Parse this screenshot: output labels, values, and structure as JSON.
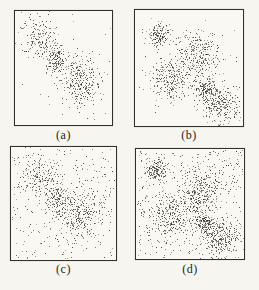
{
  "figure": {
    "background": "#f7f5f0",
    "panel_background": "#faf8f3",
    "border_color": "#33302b",
    "dot_color_rgb": [
      50,
      46,
      40
    ],
    "label_color": "#211f1c"
  },
  "chart_data": {
    "type": "scatter",
    "title": "",
    "xlabel": "",
    "ylabel": "",
    "axes_visible": false,
    "legend": "none",
    "layout": "2x2 grid of framed point plots labelled (a)-(d); coordinates below are relative (0-1) within each frame",
    "point_style": "tiny dark 1px speckle dots (scanned halftone look)",
    "panels": [
      {
        "label": "(a)",
        "description": "Three Gaussian clusters on a diagonal, almost no background noise",
        "clusters": [
          {
            "cx": 0.26,
            "cy": 0.23,
            "sx": 0.1,
            "sy": 0.095,
            "n": 180
          },
          {
            "cx": 0.42,
            "cy": 0.43,
            "sx": 0.06,
            "sy": 0.06,
            "n": 150
          },
          {
            "cx": 0.66,
            "cy": 0.62,
            "sx": 0.115,
            "sy": 0.11,
            "n": 320
          }
        ],
        "noise_n": 18,
        "seed": 101
      },
      {
        "label": "(b)",
        "description": "Five Gaussian clusters (two small tight, three large diffuse), almost no background noise",
        "clusters": [
          {
            "cx": 0.22,
            "cy": 0.21,
            "sx": 0.05,
            "sy": 0.05,
            "n": 150
          },
          {
            "cx": 0.6,
            "cy": 0.38,
            "sx": 0.1,
            "sy": 0.1,
            "n": 280
          },
          {
            "cx": 0.33,
            "cy": 0.6,
            "sx": 0.1,
            "sy": 0.095,
            "n": 280
          },
          {
            "cx": 0.655,
            "cy": 0.67,
            "sx": 0.05,
            "sy": 0.05,
            "n": 160
          },
          {
            "cx": 0.8,
            "cy": 0.82,
            "sx": 0.095,
            "sy": 0.08,
            "n": 260
          }
        ],
        "noise_n": 30,
        "seed": 202
      },
      {
        "label": "(c)",
        "description": "Same three clusters as (a) with uniform background noise added",
        "clusters": [
          {
            "cx": 0.26,
            "cy": 0.24,
            "sx": 0.1,
            "sy": 0.095,
            "n": 170
          },
          {
            "cx": 0.43,
            "cy": 0.44,
            "sx": 0.06,
            "sy": 0.06,
            "n": 140
          },
          {
            "cx": 0.64,
            "cy": 0.59,
            "sx": 0.115,
            "sy": 0.11,
            "n": 300
          }
        ],
        "noise_n": 260,
        "seed": 303
      },
      {
        "label": "(d)",
        "description": "Same five clusters as (b) with heavy uniform background noise added",
        "clusters": [
          {
            "cx": 0.19,
            "cy": 0.19,
            "sx": 0.05,
            "sy": 0.05,
            "n": 150
          },
          {
            "cx": 0.59,
            "cy": 0.38,
            "sx": 0.1,
            "sy": 0.1,
            "n": 270
          },
          {
            "cx": 0.33,
            "cy": 0.6,
            "sx": 0.1,
            "sy": 0.095,
            "n": 270
          },
          {
            "cx": 0.64,
            "cy": 0.67,
            "sx": 0.05,
            "sy": 0.05,
            "n": 160
          },
          {
            "cx": 0.79,
            "cy": 0.81,
            "sx": 0.095,
            "sy": 0.08,
            "n": 250
          }
        ],
        "noise_n": 450,
        "seed": 404
      }
    ]
  }
}
